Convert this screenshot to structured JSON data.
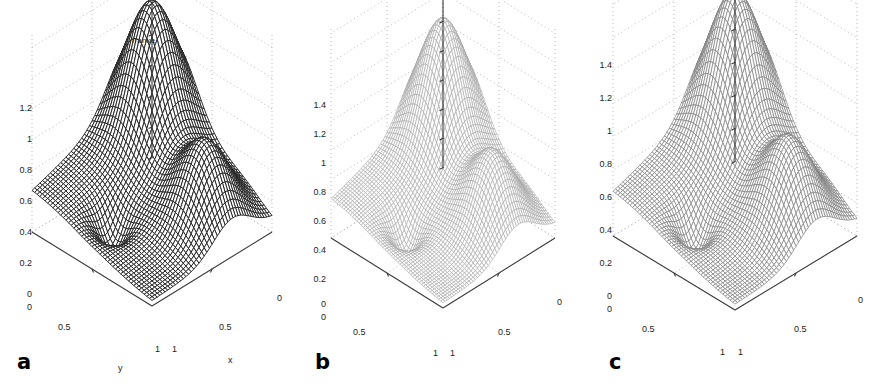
{
  "figure": {
    "background": "#ffffff",
    "panel_count": 3,
    "width": 889,
    "height": 391
  },
  "chart_data": [
    {
      "type": "surface",
      "panel": "a",
      "title": "franke",
      "xlabel": "x",
      "ylabel": "y",
      "zlabel": "",
      "xticks": [
        "0",
        "0.5",
        "1"
      ],
      "yticks": [
        "0",
        "0.5",
        "1"
      ],
      "zticks": [
        "0",
        "0.2",
        "0.4",
        "0.6",
        "0.8",
        "1",
        "1.2"
      ],
      "xlim": [
        0,
        1
      ],
      "ylim": [
        0,
        1
      ],
      "zlim": [
        0,
        1.2
      ],
      "grid": true,
      "mesh_shade": "dark",
      "mesh_color": "#3a3a3a",
      "description": "Franke's function rendered as a dense dark wireframe mesh surface; single tall central peak near 1.25, a secondary broad ridge on the left foreground, and a small depression in the right foreground.",
      "peak_value": 1.25,
      "surface_samples": {
        "x": [
          0,
          0.125,
          0.25,
          0.375,
          0.5,
          0.625,
          0.75,
          0.875,
          1
        ],
        "y": [
          0,
          0.125,
          0.25,
          0.375,
          0.5,
          0.625,
          0.75,
          0.875,
          1
        ],
        "z": [
          [
            0.76,
            0.89,
            0.89,
            0.72,
            0.49,
            0.3,
            0.18,
            0.11,
            0.07
          ],
          [
            0.83,
            1.02,
            1.06,
            0.88,
            0.59,
            0.34,
            0.19,
            0.11,
            0.07
          ],
          [
            0.8,
            1.02,
            1.12,
            0.97,
            0.66,
            0.37,
            0.2,
            0.11,
            0.06
          ],
          [
            0.67,
            0.88,
            1.0,
            0.9,
            0.63,
            0.36,
            0.19,
            0.1,
            0.05
          ],
          [
            0.5,
            0.66,
            0.77,
            0.71,
            0.51,
            0.3,
            0.16,
            0.08,
            0.04
          ],
          [
            0.35,
            0.45,
            0.52,
            0.49,
            0.36,
            0.22,
            0.12,
            0.06,
            0.03
          ],
          [
            0.24,
            0.28,
            0.31,
            0.29,
            0.22,
            0.14,
            0.08,
            0.04,
            0.02
          ],
          [
            0.16,
            0.16,
            0.16,
            0.15,
            0.12,
            0.08,
            0.05,
            0.03,
            0.02
          ],
          [
            0.1,
            0.08,
            0.07,
            0.07,
            0.06,
            0.05,
            0.03,
            0.02,
            0.01
          ]
        ]
      }
    },
    {
      "type": "surface",
      "panel": "b",
      "title": "",
      "xlabel": "",
      "ylabel": "",
      "zlabel": "",
      "xticks": [
        "0",
        "0.5",
        "1"
      ],
      "yticks": [
        "0",
        "0.5",
        "1"
      ],
      "zticks": [
        "0",
        "0.2",
        "0.4",
        "0.6",
        "0.8",
        "1",
        "1.2",
        "1.4"
      ],
      "xlim": [
        0,
        1
      ],
      "ylim": [
        0,
        1
      ],
      "zlim": [
        0,
        1.4
      ],
      "grid": true,
      "mesh_shade": "light",
      "mesh_color": "#9a9a9a",
      "description": "Reconstructed / approximated Franke surface drawn as a light grey wireframe mesh; same topology as panel a but peak slightly higher near 1.35 and a visible dark dimple in the right foreground.",
      "peak_value": 1.35
    },
    {
      "type": "surface",
      "panel": "c",
      "title": "",
      "xlabel": "",
      "ylabel": "",
      "zlabel": "",
      "xticks": [
        "0",
        "0.5",
        "1"
      ],
      "yticks": [
        "0",
        "0.5",
        "1"
      ],
      "zticks": [
        "0",
        "0.2",
        "0.4",
        "0.6",
        "0.8",
        "1",
        "1.2",
        "1.4"
      ],
      "xlim": [
        0,
        1
      ],
      "ylim": [
        0,
        1
      ],
      "zlim": [
        0,
        1.4
      ],
      "grid": true,
      "mesh_shade": "medium",
      "mesh_color": "#8c8c8c",
      "description": "Second reconstruction of Franke's function as a medium grey wireframe mesh; peak about 1.4, left ridge and right foreground dip both reproduced.",
      "peak_value": 1.4
    }
  ],
  "panels": [
    {
      "letter": "a",
      "title": "franke",
      "axis_labels": {
        "x": "x",
        "y": "y"
      },
      "z_ticks": [
        "1.2",
        "1",
        "0.8",
        "0.6",
        "0.4",
        "0.2",
        "0"
      ],
      "z_origin": "0",
      "left_x_ticks": [
        "0.5",
        "1"
      ],
      "right_x_ticks": [
        "0",
        "0.5",
        "1"
      ]
    },
    {
      "letter": "b",
      "title": "",
      "axis_labels": {
        "x": "",
        "y": ""
      },
      "z_ticks": [
        "1.4",
        "1.2",
        "1",
        "0.8",
        "0.6",
        "0.4",
        "0.2",
        "0"
      ],
      "z_origin": "0",
      "left_x_ticks": [
        "0.5",
        "1"
      ],
      "right_x_ticks": [
        "0",
        "0.5",
        "1"
      ]
    },
    {
      "letter": "c",
      "title": "",
      "axis_labels": {
        "x": "",
        "y": ""
      },
      "z_ticks": [
        "1.4",
        "1.2",
        "1",
        "0.8",
        "0.6",
        "0.4",
        "0.2",
        "0"
      ],
      "z_origin": "0",
      "left_x_ticks": [
        "0.5",
        "1"
      ],
      "right_x_ticks": [
        "0",
        "0.5",
        "1"
      ]
    }
  ]
}
